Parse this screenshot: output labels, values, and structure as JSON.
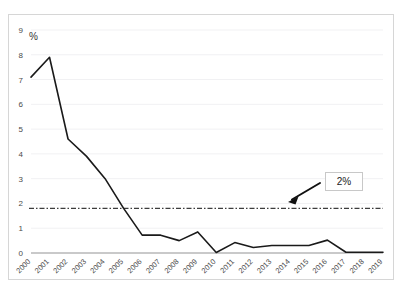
{
  "chart_data": {
    "type": "line",
    "title": "",
    "subtitle": "",
    "xlabel": "",
    "ylabel": "%",
    "y_unit_label": "%",
    "categories": [
      "2000",
      "2001",
      "2002",
      "2003",
      "2004",
      "2005",
      "2006",
      "2007",
      "2008",
      "2009",
      "2010",
      "2011",
      "2012",
      "2013",
      "2014",
      "2015",
      "2016",
      "2017",
      "2018",
      "2019"
    ],
    "values": [
      7.1,
      7.9,
      4.6,
      3.9,
      3.0,
      1.8,
      0.72,
      0.72,
      0.5,
      0.85,
      0.02,
      0.42,
      0.22,
      0.3,
      0.3,
      0.3,
      0.52,
      0.03,
      0.03,
      0.03
    ],
    "series": [
      {
        "name": "",
        "values": [
          7.1,
          7.9,
          4.6,
          3.9,
          3.0,
          1.8,
          0.72,
          0.72,
          0.5,
          0.85,
          0.02,
          0.42,
          0.22,
          0.3,
          0.3,
          0.3,
          0.52,
          0.03,
          0.03,
          0.03
        ]
      }
    ],
    "ylim": [
      0,
      9
    ],
    "y_ticks": [
      "0",
      "1",
      "2",
      "3",
      "4",
      "5",
      "6",
      "7",
      "8",
      "9"
    ],
    "xlim_labels": [
      "2000",
      "2019"
    ],
    "grid": true,
    "grid_axis": "y",
    "legend": false,
    "legend_position": "none",
    "x_tick_rotation": -45,
    "annotations": [
      {
        "name": "threshold-label",
        "text": "2%",
        "type": "boxed-label-with-arrow",
        "target_value": 1.8,
        "arrow_direction": "down-left"
      }
    ],
    "reference_lines": [
      {
        "name": "two-percent-threshold",
        "value": 1.8,
        "style": "dash-dot",
        "label": "2%"
      }
    ],
    "colors": {
      "line": "#1a1a1a",
      "threshold": "#3d3d3d",
      "grid": "#f1f1f3",
      "border": "#d6d6d6",
      "background": "#ffffff",
      "tick_text": "#4a4a4a"
    }
  }
}
